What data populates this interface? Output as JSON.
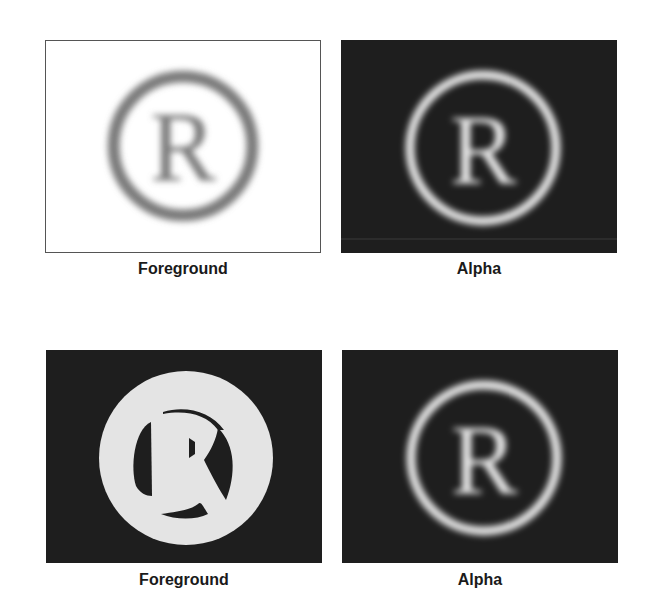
{
  "figure": {
    "rows": [
      {
        "panels": [
          {
            "caption": "Foreground",
            "content": "blurred gray registered-trademark symbol on white background",
            "symbol": "R",
            "bg_color": "#ffffff",
            "fg_color": "#7a7a7a"
          },
          {
            "caption": "Alpha",
            "content": "blurred white registered-trademark symbol on dark background",
            "symbol": "R",
            "bg_color": "#1e1e1e",
            "fg_color": "#e6e6e6"
          }
        ]
      },
      {
        "panels": [
          {
            "caption": "Foreground",
            "content": "solid light disc with dark R-shaped cutouts on dark background",
            "symbol": "R",
            "bg_color": "#1e1e1e",
            "fg_color": "#e4e4e4"
          },
          {
            "caption": "Alpha",
            "content": "blurred white registered-trademark symbol on dark background",
            "symbol": "R",
            "bg_color": "#1e1e1e",
            "fg_color": "#e6e6e6"
          }
        ]
      }
    ]
  }
}
